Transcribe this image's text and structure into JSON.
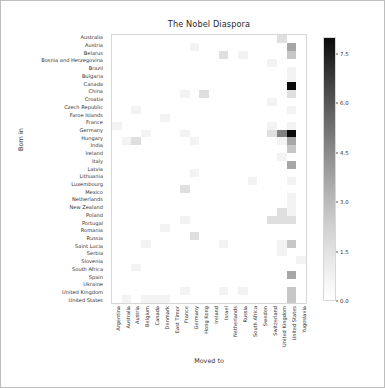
{
  "chart_data": {
    "type": "heatmap",
    "title": "The Nobel Diaspora",
    "xlabel": "Moved to",
    "ylabel": "Born in",
    "colormap": "Greys",
    "grid": false,
    "legend_position": "right-colorbar",
    "zlim": [
      0.0,
      8.0
    ],
    "colorbar_ticks": [
      "0.0",
      "1.5",
      "3.0",
      "4.5",
      "6.0",
      "7.5"
    ],
    "colorbar_tick_values": [
      0.0,
      1.5,
      3.0,
      4.5,
      6.0,
      7.5
    ],
    "x_categories": [
      "Argentina",
      "Australia",
      "Austria",
      "Belgium",
      "Canada",
      "Denmark",
      "East Timor",
      "France",
      "Germany",
      "Hong Kong",
      "Ireland",
      "Israel",
      "Netherlands",
      "Russia",
      "South Africa",
      "Sweden",
      "Switzerland",
      "United Kingdom",
      "United States",
      "Yugoslavia"
    ],
    "y_categories": [
      "Australia",
      "Austria",
      "Belarus",
      "Bosnia and Herzegovina",
      "Brazil",
      "Bulgaria",
      "Canada",
      "China",
      "Croatia",
      "Czech Republic",
      "Faroe Islands",
      "France",
      "Germany",
      "Hungary",
      "India",
      "Ireland",
      "Italy",
      "Latvia",
      "Lithuania",
      "Luxembourg",
      "Mexico",
      "Netherlands",
      "New Zealand",
      "Poland",
      "Portugal",
      "Romania",
      "Russia",
      "Saint Lucia",
      "Serbia",
      "Slovenia",
      "South Africa",
      "Spain",
      "Ukraine",
      "United Kingdom",
      "United States"
    ],
    "values": [
      [
        0,
        0,
        0,
        0,
        0,
        0,
        0,
        0,
        0,
        0,
        0,
        0,
        0,
        0,
        0,
        0,
        0,
        2,
        0,
        0
      ],
      [
        0,
        0,
        0,
        0,
        0,
        0,
        0,
        0,
        1,
        0,
        0,
        0,
        0,
        0,
        0,
        0,
        0,
        0,
        4,
        0
      ],
      [
        0,
        0,
        0,
        0,
        0,
        0,
        0,
        0,
        0,
        0,
        0,
        2,
        0,
        1,
        0,
        0,
        0,
        0,
        3,
        0
      ],
      [
        0,
        0,
        0,
        0,
        0,
        0,
        0,
        0,
        0,
        0,
        0,
        0,
        0,
        0,
        0,
        0,
        1,
        0,
        0,
        0
      ],
      [
        0,
        0,
        0,
        0,
        0,
        0,
        0,
        0,
        0,
        0,
        0,
        0,
        0,
        0,
        0,
        0,
        0,
        0,
        1,
        0
      ],
      [
        0,
        0,
        0,
        0,
        0,
        0,
        0,
        0,
        0,
        0,
        0,
        0,
        0,
        0,
        0,
        0,
        0,
        0,
        1,
        0
      ],
      [
        0,
        0,
        0,
        0,
        0,
        0,
        0,
        0,
        0,
        0,
        0,
        0,
        0,
        0,
        0,
        0,
        0,
        0,
        8,
        0
      ],
      [
        0,
        0,
        0,
        0,
        0,
        0,
        0,
        1,
        0,
        2,
        0,
        0,
        0,
        0,
        0,
        0,
        0,
        0,
        2,
        0
      ],
      [
        0,
        0,
        0,
        0,
        0,
        0,
        0,
        0,
        0,
        0,
        0,
        0,
        0,
        0,
        0,
        0,
        1,
        0,
        0,
        0
      ],
      [
        0,
        0,
        1,
        0,
        0,
        0,
        0,
        0,
        0,
        0,
        0,
        0,
        0,
        0,
        0,
        0,
        0,
        0,
        1,
        0
      ],
      [
        0,
        0,
        0,
        0,
        0,
        1,
        0,
        0,
        0,
        0,
        0,
        0,
        0,
        0,
        0,
        0,
        0,
        0,
        0,
        0
      ],
      [
        1,
        0,
        0,
        0,
        0,
        0,
        0,
        0,
        0,
        0,
        0,
        0,
        0,
        0,
        0,
        0,
        1,
        0,
        1,
        0
      ],
      [
        0,
        0,
        0,
        1,
        0,
        0,
        0,
        1,
        0,
        0,
        0,
        0,
        0,
        0,
        0,
        0,
        2,
        5,
        8,
        0
      ],
      [
        0,
        1,
        2,
        0,
        0,
        0,
        0,
        0,
        1,
        0,
        0,
        0,
        0,
        0,
        0,
        0,
        0,
        1,
        4,
        0
      ],
      [
        0,
        0,
        0,
        0,
        0,
        0,
        0,
        0,
        0,
        0,
        0,
        0,
        0,
        0,
        0,
        0,
        0,
        0,
        3,
        0
      ],
      [
        0,
        0,
        0,
        0,
        0,
        0,
        0,
        0,
        0,
        0,
        0,
        0,
        0,
        0,
        0,
        0,
        0,
        1,
        0,
        0
      ],
      [
        0,
        0,
        0,
        0,
        0,
        0,
        0,
        0,
        0,
        0,
        0,
        0,
        0,
        0,
        0,
        0,
        0,
        0,
        4,
        0
      ],
      [
        0,
        0,
        0,
        0,
        0,
        0,
        0,
        0,
        1,
        0,
        0,
        0,
        0,
        0,
        0,
        0,
        0,
        0,
        0,
        0
      ],
      [
        0,
        0,
        0,
        0,
        0,
        0,
        0,
        0,
        0,
        0,
        0,
        0,
        0,
        0,
        1,
        0,
        0,
        0,
        1,
        0
      ],
      [
        0,
        0,
        0,
        0,
        0,
        0,
        0,
        2,
        0,
        0,
        0,
        0,
        0,
        0,
        0,
        0,
        0,
        0,
        0,
        0
      ],
      [
        0,
        0,
        0,
        0,
        0,
        0,
        0,
        0,
        0,
        0,
        0,
        0,
        0,
        0,
        0,
        0,
        0,
        0,
        1,
        0
      ],
      [
        0,
        0,
        0,
        0,
        0,
        0,
        0,
        0,
        0,
        0,
        0,
        0,
        0,
        0,
        0,
        0,
        0,
        0,
        1,
        0
      ],
      [
        0,
        0,
        0,
        0,
        0,
        0,
        0,
        0,
        0,
        0,
        0,
        0,
        0,
        0,
        0,
        0,
        0,
        2,
        1,
        0
      ],
      [
        0,
        0,
        0,
        0,
        0,
        0,
        0,
        1,
        0,
        0,
        0,
        0,
        0,
        0,
        0,
        0,
        2,
        2,
        2,
        0
      ],
      [
        0,
        0,
        0,
        0,
        0,
        1,
        0,
        0,
        0,
        0,
        0,
        0,
        0,
        0,
        0,
        0,
        0,
        0,
        0,
        0
      ],
      [
        0,
        0,
        0,
        0,
        0,
        0,
        0,
        0,
        2,
        0,
        0,
        0,
        0,
        0,
        0,
        0,
        0,
        0,
        0,
        0
      ],
      [
        0,
        0,
        0,
        1,
        0,
        0,
        0,
        0,
        0,
        0,
        0,
        1,
        0,
        0,
        0,
        0,
        0,
        1,
        3,
        0
      ],
      [
        0,
        0,
        0,
        0,
        0,
        0,
        0,
        0,
        0,
        0,
        0,
        0,
        0,
        0,
        0,
        0,
        0,
        1,
        0,
        0
      ],
      [
        0,
        0,
        0,
        0,
        0,
        0,
        0,
        0,
        0,
        0,
        0,
        0,
        0,
        0,
        0,
        0,
        0,
        0,
        0,
        1
      ],
      [
        0,
        0,
        1,
        0,
        0,
        0,
        0,
        0,
        0,
        0,
        0,
        0,
        0,
        0,
        0,
        0,
        0,
        0,
        0,
        0
      ],
      [
        0,
        0,
        0,
        0,
        0,
        0,
        0,
        0,
        0,
        0,
        0,
        0,
        0,
        0,
        0,
        0,
        0,
        0,
        4,
        0
      ],
      [
        0,
        0,
        0,
        0,
        0,
        0,
        0,
        0,
        0,
        0,
        0,
        0,
        0,
        0,
        0,
        0,
        0,
        0,
        0,
        0
      ],
      [
        0,
        0,
        0,
        0,
        0,
        0,
        0,
        1,
        0,
        0,
        0,
        1,
        0,
        1,
        0,
        0,
        0,
        0,
        3,
        0
      ],
      [
        0,
        1,
        0,
        1,
        1,
        1,
        0,
        0,
        0,
        0,
        0,
        0,
        0,
        0,
        0,
        0,
        0,
        0,
        3,
        0
      ],
      [
        0,
        0,
        0,
        0,
        0,
        0,
        0,
        0,
        0,
        0,
        0,
        0,
        0,
        0,
        0,
        0,
        0,
        1,
        0,
        0
      ]
    ]
  }
}
